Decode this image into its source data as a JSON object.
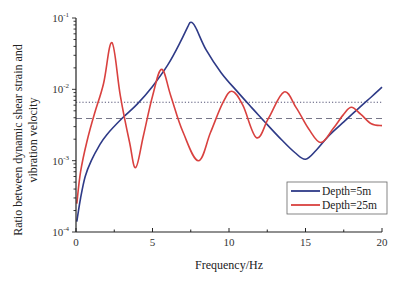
{
  "chart_data": {
    "type": "line",
    "title": "",
    "xlabel": "Frequency/Hz",
    "ylabel_line1": "Ratio between dynamic shear strain and",
    "ylabel_line2": "vibration velocity",
    "xlim": [
      0,
      20
    ],
    "ylim": [
      0.0001,
      0.1
    ],
    "yscale": "log",
    "x_ticks": [
      0,
      5,
      10,
      15,
      20
    ],
    "y_ticks": [
      {
        "base": "10",
        "exp": "-4",
        "value": 0.0001
      },
      {
        "base": "10",
        "exp": "-3",
        "value": 0.001
      },
      {
        "base": "10",
        "exp": "-2",
        "value": 0.01
      },
      {
        "base": "10",
        "exp": "-1",
        "value": 0.1
      }
    ],
    "legend_position": "lower right",
    "series": [
      {
        "name": "Depth=5m",
        "color": "#2e3a87",
        "x": [
          0.05,
          0.3,
          0.6,
          1,
          1.5,
          2,
          3,
          4,
          5,
          6,
          6.8,
          7.3,
          7.5,
          7.8,
          8.5,
          9.5,
          10.5,
          11.5,
          12.5,
          13.5,
          14.3,
          15,
          15.7,
          16.5,
          17.5,
          18.5,
          19.3,
          20
        ],
        "y": [
          0.00014,
          0.0003,
          0.0006,
          0.001,
          0.0016,
          0.0023,
          0.0039,
          0.0062,
          0.011,
          0.022,
          0.045,
          0.075,
          0.087,
          0.075,
          0.036,
          0.017,
          0.0095,
          0.0055,
          0.0032,
          0.0019,
          0.0013,
          0.00105,
          0.0014,
          0.0022,
          0.0035,
          0.0055,
          0.0078,
          0.0107
        ]
      },
      {
        "name": "Depth=25m",
        "color": "#d9413f",
        "x": [
          0.05,
          0.3,
          0.7,
          1.2,
          1.8,
          2.35,
          2.9,
          3.5,
          3.9,
          4.4,
          5,
          5.6,
          6.2,
          7,
          8,
          8.8,
          9.6,
          10.2,
          10.9,
          11.8,
          12.6,
          13.6,
          14.4,
          15.2,
          16,
          16.8,
          17.5,
          18,
          18.6,
          19.3,
          20
        ],
        "y": [
          0.00025,
          0.0007,
          0.0018,
          0.0045,
          0.012,
          0.045,
          0.008,
          0.0018,
          0.0008,
          0.0022,
          0.008,
          0.019,
          0.008,
          0.0025,
          0.001,
          0.0025,
          0.0065,
          0.0094,
          0.006,
          0.0021,
          0.004,
          0.0092,
          0.0055,
          0.0028,
          0.0018,
          0.0028,
          0.0045,
          0.0056,
          0.0045,
          0.0033,
          0.0031
        ]
      }
    ],
    "reference_lines": [
      {
        "style": "dotted",
        "value": 0.0066,
        "color": "#555577"
      },
      {
        "style": "dashed",
        "value": 0.0039,
        "color": "#777788"
      }
    ]
  }
}
